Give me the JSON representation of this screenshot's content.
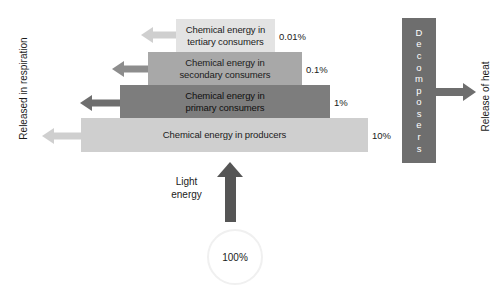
{
  "diagram": {
    "colors": {
      "tertiary_bar": "#e3e3e3",
      "secondary_bar": "#a8a8a8",
      "primary_bar": "#7d7d7d",
      "producers_bar": "#cfcfcf",
      "decomposers_box": "#6e6e6e",
      "light_arrow": "#555555",
      "text": "#1b1b1b",
      "background": "#ffffff"
    }
  },
  "chart_data": {
    "type": "bar",
    "xlabel": "",
    "ylabel": "",
    "categories": [
      "Chemical energy in tertiary consumers",
      "Chemical energy in secondary consumers",
      "Chemical energy in primary consumers",
      "Chemical energy in producers"
    ],
    "values": [
      0.01,
      0.1,
      1,
      10
    ],
    "value_labels": [
      "0.01%",
      "0.1%",
      "1%",
      "10%"
    ],
    "input": {
      "label": "Light energy",
      "value": 100,
      "value_label": "100%"
    },
    "annotations": [
      "Released in respiration",
      "Decomposers",
      "Release of heat"
    ],
    "grid": false,
    "legend": false
  },
  "levels": [
    {
      "id": "tertiary",
      "line1": "Chemical energy in",
      "line2": "tertiary consumers",
      "percent": "0.01%"
    },
    {
      "id": "secondary",
      "line1": "Chemical energy in",
      "line2": "secondary consumers",
      "percent": "0.1%"
    },
    {
      "id": "primary",
      "line1": "Chemical energy in",
      "line2": "primary consumers",
      "percent": "1%"
    },
    {
      "id": "producers",
      "line1": "Chemical energy in producers",
      "line2": "",
      "percent": "10%"
    }
  ],
  "respiration": {
    "label": "Released in respiration"
  },
  "light": {
    "line1": "Light",
    "line2": "energy",
    "input_percent": "100%"
  },
  "decomposers": {
    "label": "Decomposers",
    "letters": [
      "D",
      "e",
      "c",
      "o",
      "m",
      "p",
      "o",
      "s",
      "e",
      "r",
      "s"
    ]
  },
  "heat": {
    "label": "Release of heat"
  }
}
